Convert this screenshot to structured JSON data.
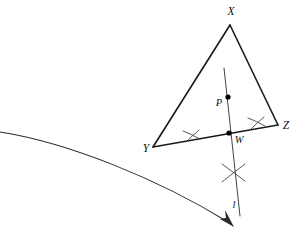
{
  "figure": {
    "kind": "geometry-construction",
    "background_color": "#ffffff",
    "ink_color": "#1a1a1a",
    "canvas": {
      "width": 298,
      "height": 234
    }
  },
  "labels": {
    "vertex_x": "X",
    "vertex_y": "Y",
    "vertex_z": "Z",
    "point_p": "P",
    "point_w": "W",
    "line_l": "l"
  },
  "points": {
    "X": {
      "label": "X",
      "x": 230,
      "y": 25,
      "label_x": 231,
      "label_y": 15,
      "marked": false
    },
    "Y": {
      "label": "Y",
      "x": 153,
      "y": 147,
      "label_x": 146,
      "label_y": 152,
      "marked": false
    },
    "Z": {
      "label": "Z",
      "x": 278,
      "y": 125,
      "label_x": 285,
      "label_y": 128,
      "marked": false
    },
    "P": {
      "label": "P",
      "x": 228,
      "y": 97,
      "label_x": 219,
      "label_y": 105,
      "marked": true
    },
    "W": {
      "label": "W",
      "x": 229,
      "y": 133,
      "label_x": 236,
      "label_y": 143,
      "marked": true
    }
  },
  "segments": {
    "XY": {
      "from": "X",
      "to": "Y"
    },
    "XZ": {
      "from": "X",
      "to": "Z"
    },
    "YZ": {
      "from": "Y",
      "to": "Z"
    }
  },
  "line_l": {
    "label": "l",
    "label_x": 235,
    "label_y": 206,
    "start_x": 224,
    "start_y": 68,
    "end_x": 240,
    "end_y": 216,
    "description": "perpendicular through P meeting YZ at W"
  },
  "construction_arcs": {
    "left_tick_on_yz": {
      "x": 192,
      "y": 136
    },
    "right_tick_on_yz": {
      "x": 256,
      "y": 123
    },
    "cross_below_w": {
      "x": 233,
      "y": 173
    }
  },
  "sweep_curve": {
    "description": "large arrow arc sweeping from left edge down to the right",
    "start_x": 0,
    "start_y": 132,
    "end_x": 232,
    "end_y": 226,
    "arrow_at_end": true
  }
}
